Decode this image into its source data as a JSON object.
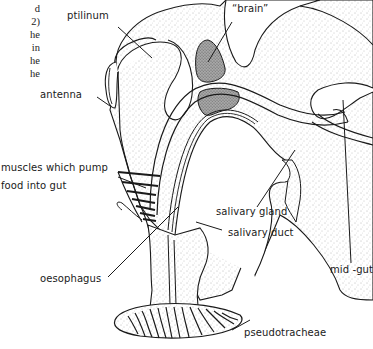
{
  "page_fragment": {
    "lines": [
      "d",
      "2)",
      "he",
      "in",
      "he",
      "he"
    ]
  },
  "diagram": {
    "labels": {
      "ptilinum": "ptilinum",
      "brain": "“brain”",
      "antenna": "antenna",
      "muscles_line1": "muscles which pump",
      "muscles_line2": "food into gut",
      "salivary_gland": "salivary gland",
      "salivary_duct": "salivary duct",
      "mid_gut": "mid -gut",
      "oesophagus": "oesophagus",
      "pseudotracheae": "pseudotracheae"
    },
    "colors": {
      "line": "#1a1a1a",
      "stipple": "#8a8a8a",
      "brain_fill": "#9a9a9a",
      "background": "#ffffff"
    }
  }
}
